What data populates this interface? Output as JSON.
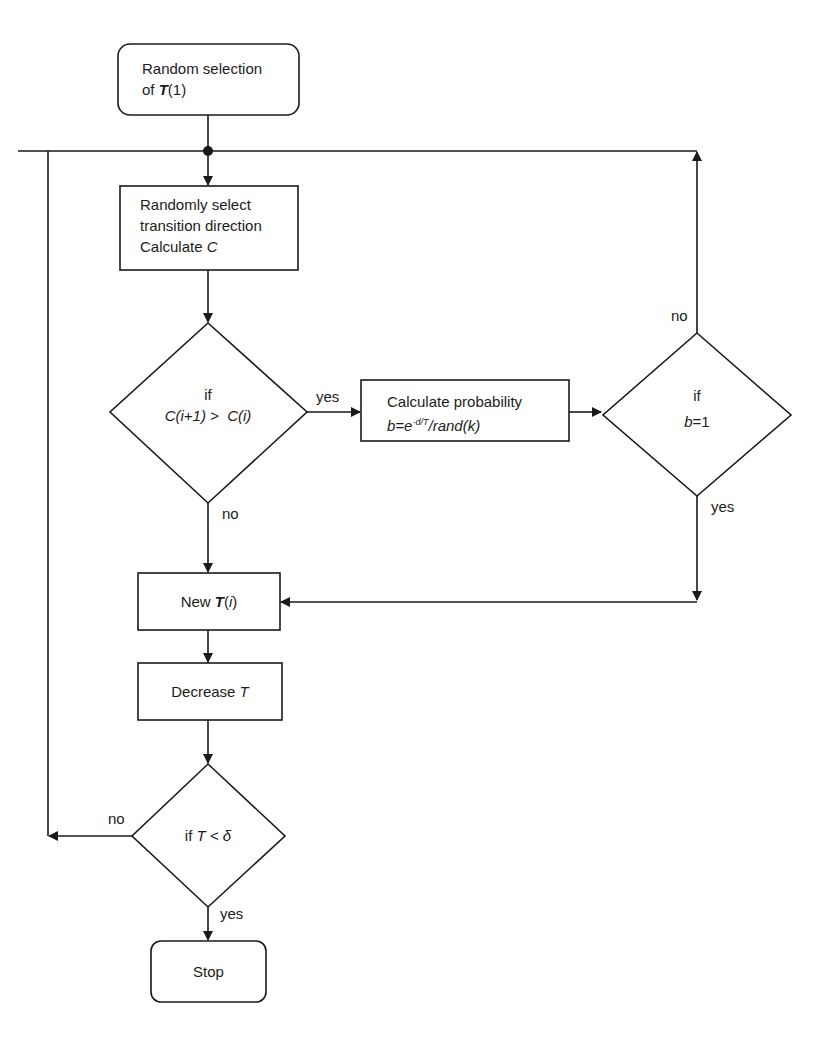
{
  "diagram": {
    "type": "flowchart",
    "colors": {
      "stroke": "#1a1a1a",
      "background": "#ffffff",
      "text": "#1c1c1c"
    },
    "nodes": {
      "start": {
        "shape": "rounded-rect",
        "line1": "Random selection",
        "line2_prefix": "of ",
        "line2_var": "T",
        "line2_suffix": "(1)"
      },
      "select": {
        "shape": "rect",
        "line1": "Randomly select",
        "line2": "transition direction",
        "line3_prefix": "Calculate ",
        "line3_var": "C"
      },
      "decision_cost": {
        "shape": "diamond",
        "line1": "if",
        "line2": "C(i+1) >  C(i)"
      },
      "probability": {
        "shape": "rect",
        "line1": "Calculate probability",
        "formula_b": "b",
        "formula_eq": "=e",
        "formula_exp": "-d/T",
        "formula_rest": "/rand(k)"
      },
      "decision_b": {
        "shape": "diamond",
        "line1": "if",
        "line2_var": "b",
        "line2_rest": "=1"
      },
      "new_t": {
        "shape": "rect",
        "prefix": "New ",
        "var": "T",
        "suffix_open": "(",
        "suffix_i": "i",
        "suffix_close": ")"
      },
      "decrease": {
        "shape": "rect",
        "prefix": "Decrease ",
        "var": "T"
      },
      "decision_t": {
        "shape": "diamond",
        "prefix": "if ",
        "var": "T",
        "rest": " < δ"
      },
      "stop": {
        "shape": "rounded-rect",
        "label": "Stop"
      }
    },
    "edge_labels": {
      "cost_yes": "yes",
      "cost_no": "no",
      "b_no": "no",
      "b_yes": "yes",
      "t_no": "no",
      "t_yes": "yes"
    },
    "edges": [
      {
        "from": "start",
        "to": "select"
      },
      {
        "from": "select",
        "to": "decision_cost"
      },
      {
        "from": "decision_cost",
        "to": "probability",
        "label": "yes"
      },
      {
        "from": "decision_cost",
        "to": "new_t",
        "label": "no"
      },
      {
        "from": "probability",
        "to": "decision_b"
      },
      {
        "from": "decision_b",
        "to": "select",
        "label": "no",
        "via": "top loop line"
      },
      {
        "from": "decision_b",
        "to": "new_t",
        "label": "yes"
      },
      {
        "from": "new_t",
        "to": "decrease"
      },
      {
        "from": "decrease",
        "to": "decision_t"
      },
      {
        "from": "decision_t",
        "to": "select",
        "label": "no",
        "via": "left loop line"
      },
      {
        "from": "decision_t",
        "to": "stop",
        "label": "yes"
      }
    ]
  }
}
